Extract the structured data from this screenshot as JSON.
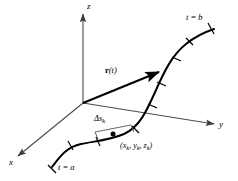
{
  "figure": {
    "kind": "3d-space-curve-diagram",
    "colors": {
      "ink": "#1a1a1a",
      "axis": "#4a4a4a",
      "curve": "#000000",
      "background": "#ffffff"
    }
  },
  "axes": {
    "x": {
      "label": "x",
      "tip": [
        13,
        160
      ],
      "origin": [
        83,
        103
      ]
    },
    "y": {
      "label": "y",
      "tip": [
        218,
        125
      ],
      "origin": [
        83,
        103
      ]
    },
    "z": {
      "label": "z",
      "tip": [
        83,
        10
      ],
      "origin": [
        83,
        103
      ]
    }
  },
  "vector": {
    "label_bold": "r",
    "label_arg": "(t)",
    "from": [
      83,
      103
    ],
    "to": [
      160,
      72
    ]
  },
  "curve": {
    "start_label": "t = a",
    "end_label": "t = b",
    "tick_count": 8
  },
  "arc_element": {
    "label_delta": "Δ",
    "label_s": "s",
    "label_sub": "k"
  },
  "point": {
    "label_open": "(",
    "label_x": "x",
    "label_y": "y",
    "label_z": "z",
    "label_sub": "k",
    "label_close": ")",
    "label_full": "(xₖ, yₖ, zₖ)",
    "position": [
      117,
      140
    ]
  }
}
